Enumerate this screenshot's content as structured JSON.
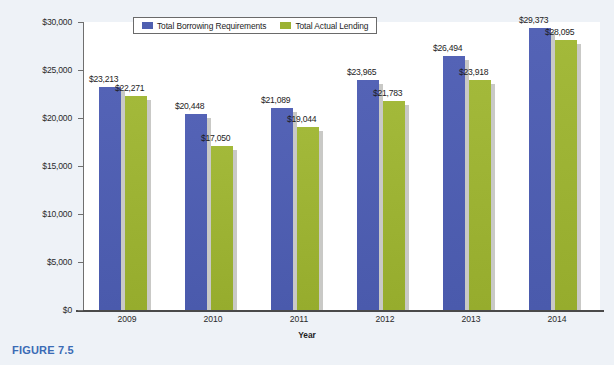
{
  "caption": "FIGURE 7.5",
  "legend": {
    "items": [
      {
        "label": "Total Borrowing Requirements",
        "color": "#4f5fb0",
        "swatch": "blue"
      },
      {
        "label": "Total Actual Lending",
        "color": "#9cb233",
        "swatch": "green"
      }
    ]
  },
  "chart_data": {
    "type": "bar",
    "title": "",
    "xlabel": "Year",
    "ylabel": "Borrowing Requirements and Actual Lending (in Billions of $)",
    "categories": [
      "2009",
      "2010",
      "2011",
      "2012",
      "2013",
      "2014"
    ],
    "series": [
      {
        "name": "Total Borrowing Requirements",
        "color": "#4f5fb0",
        "values": [
          23213,
          20448,
          21089,
          23965,
          26494,
          29373
        ],
        "labels": [
          "$23,213",
          "$20,448",
          "$21,089",
          "$23,965",
          "$26,494",
          "$29,373"
        ]
      },
      {
        "name": "Total Actual Lending",
        "color": "#9cb233",
        "values": [
          22271,
          17050,
          19044,
          21783,
          23918,
          28095
        ],
        "labels": [
          "$22,271",
          "$17,050",
          "$19,044",
          "$21,783",
          "$23,918",
          "$28,095"
        ]
      }
    ],
    "ylim": [
      0,
      30000
    ],
    "yticks": [
      0,
      5000,
      10000,
      15000,
      20000,
      25000,
      30000
    ],
    "ytick_labels": [
      "$0",
      "$5,000",
      "$10,000",
      "$15,000",
      "$20,000",
      "$25,000",
      "$30,000"
    ],
    "grid": false,
    "legend_position": "top-center"
  }
}
